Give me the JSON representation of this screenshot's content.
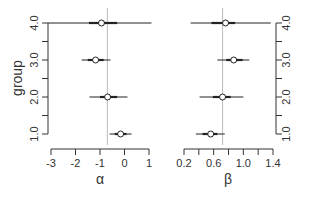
{
  "chart_data": [
    {
      "type": "scatter",
      "subtype": "forest_plot",
      "title": "",
      "xlabel": "α",
      "ylabel": "group",
      "xlim": [
        -3,
        1
      ],
      "ylim": [
        1.0,
        4.0
      ],
      "xticks": [
        "-3",
        "-2",
        "-1",
        "0",
        "1"
      ],
      "yticks": [
        "1.0",
        "2.0",
        "3.0",
        "4.0"
      ],
      "y_minor_ticks": [
        1.5,
        2.5,
        3.5
      ],
      "y_axis_side": "left",
      "reference_line": -0.7,
      "grid": false,
      "legend": null,
      "points": [
        {
          "group": 4.0,
          "estimate": -0.94,
          "ci95": [
            -3.2,
            1.1
          ],
          "ci50": [
            -1.45,
            -0.3
          ]
        },
        {
          "group": 3.0,
          "estimate": -1.18,
          "ci95": [
            -1.75,
            -0.57
          ],
          "ci50": [
            -1.5,
            -0.85
          ]
        },
        {
          "group": 2.0,
          "estimate": -0.69,
          "ci95": [
            -1.43,
            0.12
          ],
          "ci50": [
            -1.0,
            -0.3
          ]
        },
        {
          "group": 1.0,
          "estimate": -0.16,
          "ci95": [
            -0.61,
            0.29
          ],
          "ci50": [
            -0.4,
            0.08
          ]
        }
      ]
    },
    {
      "type": "scatter",
      "subtype": "forest_plot",
      "title": "",
      "xlabel": "β",
      "ylabel": "",
      "xlim": [
        0.2,
        1.4
      ],
      "ylim": [
        1.0,
        4.0
      ],
      "xticks": [
        "0.2",
        "0.6",
        "1.0",
        "1.4"
      ],
      "x_minor_ticks": [
        0.4,
        0.8,
        1.2
      ],
      "yticks": [
        "1.0",
        "2.0",
        "3.0",
        "4.0"
      ],
      "y_minor_ticks": [
        1.5,
        2.5,
        3.5
      ],
      "y_axis_side": "right",
      "reference_line": 0.72,
      "grid": false,
      "legend": null,
      "points": [
        {
          "group": 4.0,
          "estimate": 0.76,
          "ci95": [
            0.29,
            1.37
          ],
          "ci50": [
            0.57,
            0.89
          ]
        },
        {
          "group": 3.0,
          "estimate": 0.87,
          "ci95": [
            0.65,
            1.08
          ],
          "ci50": [
            0.77,
            0.99
          ]
        },
        {
          "group": 2.0,
          "estimate": 0.72,
          "ci95": [
            0.41,
            1.0
          ],
          "ci50": [
            0.59,
            0.83
          ]
        },
        {
          "group": 1.0,
          "estimate": 0.56,
          "ci95": [
            0.36,
            0.75
          ],
          "ci50": [
            0.45,
            0.65
          ]
        }
      ]
    }
  ],
  "style": {
    "axis_color": "#333333",
    "line_color": "#222222",
    "ref_line_color": "#bbbbbb",
    "background": "#ffffff"
  }
}
